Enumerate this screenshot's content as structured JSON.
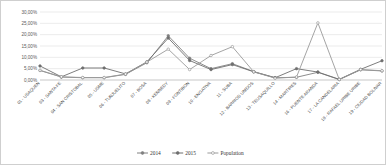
{
  "chart_data": {
    "type": "line",
    "title": "",
    "subtitle": "",
    "xlabel": "",
    "ylabel": "",
    "ylim": [
      0,
      30
    ],
    "ytick_values": [
      0,
      5,
      10,
      15,
      20,
      25,
      30
    ],
    "ytick_labels": [
      "0,00%",
      "5,00%",
      "10,00%",
      "15,00%",
      "20,00%",
      "25,00%",
      "30,00%"
    ],
    "grid": true,
    "legend_position": "bottom",
    "categories": [
      "01 - USAQUEN",
      "03 - SANTA FE",
      "04 - SAN CRISTOBAL",
      "05 - USME",
      "06 - TUNJUELITO",
      "07 - BOSA",
      "08 - KENNEDY",
      "09 - FONTIBON",
      "10 - ENGATIVA",
      "11 - SUBA",
      "12 - BARRIOS UNIDOS",
      "13 - TEUSAQUILLO",
      "14 - MARTIRES",
      "16 - PUENTE ARANDA",
      "17 - LA CANDELARIA",
      "18 - RAFAEL URIBE URIBE",
      "19 - CIUDAD BOLIVAR"
    ],
    "series": [
      {
        "name": "2014",
        "color": "#808080",
        "values": [
          4.2,
          1.3,
          1.0,
          1.0,
          2.5,
          7.6,
          19.5,
          9.6,
          5.0,
          7.2,
          3.7,
          1.0,
          1.2,
          3.4,
          0.2,
          4.5,
          4.0
        ]
      },
      {
        "name": "2015",
        "color": "#6e6e6e",
        "values": [
          6.2,
          1.4,
          5.3,
          5.3,
          2.7,
          8.0,
          18.5,
          8.6,
          4.6,
          6.8,
          3.6,
          1.0,
          5.0,
          3.5,
          0.3,
          4.7,
          8.5
        ]
      },
      {
        "name": "Population",
        "color": "#9a9a9a",
        "values": [
          4.3,
          1.4,
          1.1,
          1.1,
          2.6,
          7.9,
          13.6,
          4.6,
          10.8,
          14.7,
          3.6,
          0.8,
          1.3,
          25.2,
          0.2,
          4.6,
          4.1
        ]
      }
    ]
  },
  "legend": {
    "items": [
      {
        "label": "2014"
      },
      {
        "label": "2015"
      },
      {
        "label": "Population"
      }
    ]
  },
  "colors": {
    "gridline": "#d6d6d6",
    "axis": "#b9b9b9",
    "border": "#cfcfcf",
    "background": "#ffffff",
    "tick_text": "#5a5a5a"
  }
}
